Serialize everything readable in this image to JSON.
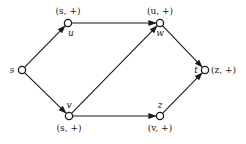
{
  "diagram": {
    "type": "directed-graph",
    "nodes": [
      {
        "id": "s",
        "name": "s",
        "label": ""
      },
      {
        "id": "u",
        "name": "u",
        "label": "(s, +)"
      },
      {
        "id": "w",
        "name": "w",
        "label": "(u, +)"
      },
      {
        "id": "v",
        "name": "v",
        "label": "(s, +)"
      },
      {
        "id": "z",
        "name": "z",
        "label": "(v, +)"
      },
      {
        "id": "t",
        "name": "t",
        "label": "(z, +)"
      }
    ],
    "edges": [
      {
        "from": "s",
        "to": "u"
      },
      {
        "from": "u",
        "to": "w"
      },
      {
        "from": "s",
        "to": "v"
      },
      {
        "from": "v",
        "to": "w"
      },
      {
        "from": "w",
        "to": "t"
      },
      {
        "from": "v",
        "to": "z"
      },
      {
        "from": "z",
        "to": "t"
      }
    ]
  }
}
